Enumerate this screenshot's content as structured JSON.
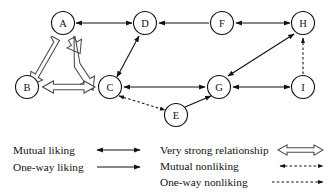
{
  "figure": {
    "background_color": "#ffffff",
    "line_color": "#111111",
    "hollow_arrow_fill": "#ffffff",
    "hollow_arrow_stroke": "#4a4a4a"
  },
  "nodes": [
    {
      "id": "A",
      "label": "A",
      "x": 63,
      "y": 23,
      "r": 11.5
    },
    {
      "id": "B",
      "label": "B",
      "x": 27,
      "y": 87,
      "r": 11.5
    },
    {
      "id": "C",
      "label": "C",
      "x": 110,
      "y": 87,
      "r": 11.5
    },
    {
      "id": "D",
      "label": "D",
      "x": 145,
      "y": 23,
      "r": 11.5
    },
    {
      "id": "E",
      "label": "E",
      "x": 176,
      "y": 115,
      "r": 11.5
    },
    {
      "id": "F",
      "label": "F",
      "x": 222,
      "y": 23,
      "r": 11.5
    },
    {
      "id": "G",
      "label": "G",
      "x": 219,
      "y": 87,
      "r": 11.5
    },
    {
      "id": "H",
      "label": "H",
      "x": 303,
      "y": 23,
      "r": 11.5
    },
    {
      "id": "I",
      "label": "I",
      "x": 303,
      "y": 87,
      "r": 11.5
    }
  ],
  "edges": [
    {
      "from": "A",
      "to": "D",
      "type": "mutual-liking"
    },
    {
      "from": "A",
      "to": "B",
      "type": "very-strong-relationship"
    },
    {
      "from": "A",
      "to": "C",
      "type": "very-strong-relationship"
    },
    {
      "from": "B",
      "to": "C",
      "type": "very-strong-relationship"
    },
    {
      "from": "C",
      "to": "D",
      "type": "mutual-liking"
    },
    {
      "from": "C",
      "to": "G",
      "type": "mutual-liking"
    },
    {
      "from": "C",
      "to": "E",
      "type": "mutual-nonliking"
    },
    {
      "from": "E",
      "to": "G",
      "type": "one-way-liking"
    },
    {
      "from": "F",
      "to": "D",
      "type": "one-way-liking"
    },
    {
      "from": "F",
      "to": "H",
      "type": "mutual-liking"
    },
    {
      "from": "G",
      "to": "H",
      "type": "mutual-liking"
    },
    {
      "from": "G",
      "to": "I",
      "type": "mutual-liking"
    },
    {
      "from": "I",
      "to": "H",
      "type": "one-way-nonliking"
    }
  ],
  "legend": {
    "left_column": [
      {
        "key": "mutual-liking",
        "label": "Mutual liking"
      },
      {
        "key": "one-way-liking",
        "label": "One-way liking"
      }
    ],
    "right_column": [
      {
        "key": "very-strong-relationship",
        "label": "Very strong relationship"
      },
      {
        "key": "mutual-nonliking",
        "label": "Mutual nonliking"
      },
      {
        "key": "one-way-nonliking",
        "label": "One-way nonliking"
      }
    ]
  }
}
